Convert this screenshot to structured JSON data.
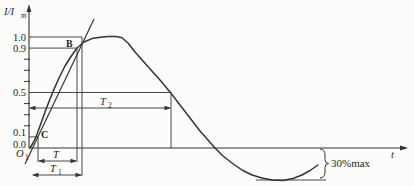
{
  "figure": {
    "y_axis_label": {
      "base": "I/I",
      "sub": "m"
    },
    "x_axis_label": "t",
    "origin_label": {
      "base": "O",
      "sub": "1"
    },
    "point_b": "B",
    "point_c": "C",
    "tick_labels": {
      "v10": "1.0",
      "v09": "0.9",
      "v05": "0.5",
      "v01": "0.1",
      "v00": "0.0"
    },
    "dim_t2": {
      "base": "T",
      "sub": "2"
    },
    "dim_t": {
      "base": "T",
      "sub": ""
    },
    "dim_t1": {
      "base": "T",
      "sub": "1"
    },
    "undershoot_label": "30%max"
  },
  "colors": {
    "ink": "#333333",
    "text": "#1f1f1f",
    "background": "#fcfcfa"
  },
  "chart_data": {
    "type": "line",
    "xlabel": "t",
    "ylabel": "I/Im",
    "ylim": [
      -0.35,
      1.1
    ],
    "grid": false,
    "y_reference_levels": [
      1.0,
      0.9,
      0.5,
      0.1,
      0.0
    ],
    "minor_tick_levels": [
      0.8,
      0.7,
      0.6,
      0.4,
      0.3,
      0.2
    ],
    "undershoot_max_fraction": 0.3,
    "annotations": [
      "B at 0.9 level",
      "C at 0.1 level",
      "O1 virtual origin",
      "T between 0.1 and 0.9",
      "T1 front time",
      "T2 time to half-value",
      "30%max reverse-polarity limit"
    ],
    "axis_px": {
      "origin_x": 29,
      "axis_y": 148,
      "unit_px_per_1": 111,
      "x_end": 408,
      "y_top": 4
    },
    "curve": [
      [
        30,
        0.0
      ],
      [
        33,
        0.045
      ],
      [
        36,
        0.099
      ],
      [
        40,
        0.198
      ],
      [
        45,
        0.324
      ],
      [
        50,
        0.441
      ],
      [
        55,
        0.55
      ],
      [
        60,
        0.649
      ],
      [
        65,
        0.739
      ],
      [
        70,
        0.811
      ],
      [
        77,
        0.901
      ],
      [
        84,
        0.955
      ],
      [
        92,
        0.986
      ],
      [
        100,
        0.998
      ],
      [
        108,
        1.004
      ],
      [
        116,
        1.004
      ],
      [
        122,
        0.993
      ],
      [
        128,
        0.946
      ],
      [
        135,
        0.865
      ],
      [
        143,
        0.784
      ],
      [
        151,
        0.703
      ],
      [
        160,
        0.613
      ],
      [
        170,
        0.505
      ],
      [
        180,
        0.387
      ],
      [
        190,
        0.27
      ],
      [
        200,
        0.153
      ],
      [
        208,
        0.072
      ],
      [
        215,
        0.0
      ],
      [
        223,
        -0.072
      ],
      [
        232,
        -0.135
      ],
      [
        242,
        -0.198
      ],
      [
        252,
        -0.243
      ],
      [
        262,
        -0.27
      ],
      [
        272,
        -0.288
      ],
      [
        283,
        -0.293
      ],
      [
        293,
        -0.275
      ],
      [
        302,
        -0.243
      ],
      [
        310,
        -0.203
      ],
      [
        318,
        -0.153
      ]
    ],
    "front_line": [
      [
        25,
        -0.144
      ],
      [
        94,
        1.162
      ]
    ],
    "level_lines": [
      {
        "level": 1.0,
        "x_end": 82
      },
      {
        "level": 0.9,
        "x_end": 77
      },
      {
        "level": 0.5,
        "x_end": 170
      },
      {
        "level": 0.1,
        "x_end": 38
      }
    ],
    "vertical_lines": [
      {
        "x": 38,
        "top_level": 0.1,
        "y_bottom": 162
      },
      {
        "x": 77,
        "top_level": 0.9,
        "y_bottom": 162
      },
      {
        "x": 82,
        "top_level": 1.0,
        "y_bottom": 176
      },
      {
        "x": 171,
        "top_level": 0.5,
        "y_bottom": 148
      }
    ],
    "dimensions": [
      {
        "name": "T2",
        "x1": 29,
        "x2": 171,
        "y": 108
      },
      {
        "name": "T",
        "x1": 38,
        "x2": 77,
        "y": 161
      },
      {
        "name": "T1",
        "x1": 32,
        "x2": 82,
        "y": 175
      }
    ],
    "undershoot_line": {
      "x1": 256,
      "x2": 326,
      "y": 180
    },
    "brace": {
      "x": 320,
      "y1": 149,
      "y2": 178
    }
  }
}
